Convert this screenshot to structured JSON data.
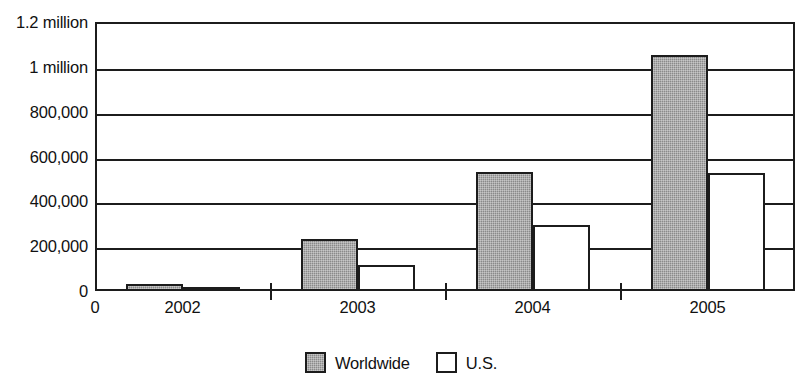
{
  "chart_data": {
    "type": "bar",
    "title": "",
    "subtitle": "",
    "xlabel": "",
    "ylabel": "",
    "categories": [
      "2002",
      "2003",
      "2004",
      "2005"
    ],
    "series": [
      {
        "name": "Worldwide",
        "values": [
          30000,
          230000,
          530000,
          1055000
        ],
        "color": "#8a8a8a"
      },
      {
        "name": "U.S.",
        "values": [
          13000,
          115000,
          293000,
          525000
        ],
        "color": "#ffffff"
      }
    ],
    "ylim": [
      0,
      1200000
    ],
    "ytick_values": [
      0,
      200000,
      400000,
      600000,
      800000,
      1000000,
      1200000
    ],
    "ytick_labels": [
      "0",
      "200,000",
      "400,000",
      "600,000",
      "800,000",
      "1 million",
      "1.2 million"
    ],
    "xtick_labels": [
      "2002",
      "2003",
      "2004",
      "2005"
    ],
    "x_origin_label": "0",
    "grid": true,
    "grid_axis": "y",
    "legend": [
      "Worldwide",
      "U.S."
    ],
    "legend_position": "bottom-center",
    "annotations": []
  },
  "axes": {
    "y_labels": [
      {
        "text": "1.2 million",
        "value": 1200000
      },
      {
        "text": "1 million",
        "value": 1000000
      },
      {
        "text": "800,000",
        "value": 800000
      },
      {
        "text": "600,000",
        "value": 600000
      },
      {
        "text": "400,000",
        "value": 400000
      },
      {
        "text": "200,000",
        "value": 200000
      },
      {
        "text": "0",
        "value": 0
      }
    ],
    "x_origin_label": "0",
    "x_labels": [
      "2002",
      "2003",
      "2004",
      "2005"
    ]
  },
  "legend": {
    "entries": [
      {
        "label": "Worldwide",
        "swatch": "filled-gray-swatch"
      },
      {
        "label": "U.S.",
        "swatch": "outline-white-swatch"
      }
    ]
  },
  "colors": {
    "worldwide_fill": "#8a8a8a",
    "us_fill": "#ffffff",
    "stroke": "#1c1c1c",
    "background": "#ffffff"
  }
}
